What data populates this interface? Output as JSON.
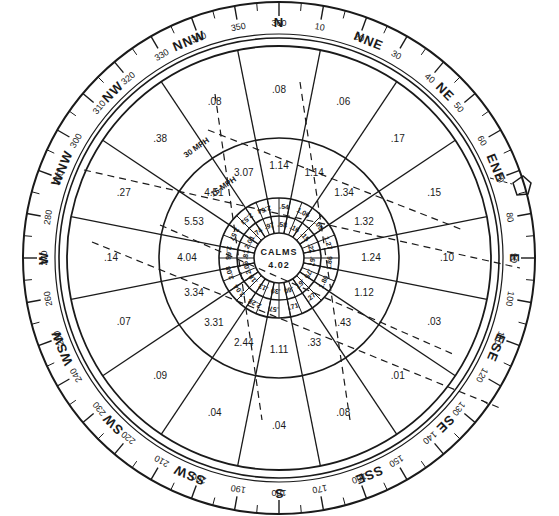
{
  "diagram": {
    "type": "wind-rose",
    "center": {
      "x": 279,
      "y": 258
    },
    "colors": {
      "ink": "#1a1a1a",
      "paper": "#ffffff"
    },
    "directions": [
      "N",
      "NNE",
      "NE",
      "ENE",
      "E",
      "ESE",
      "SE",
      "SSE",
      "S",
      "SSW",
      "SW",
      "WSW",
      "W",
      "WNW",
      "NW",
      "NNW"
    ],
    "degree_labels": [
      "360",
      "10",
      "20",
      "30",
      "40",
      "50",
      "60",
      "70",
      "80",
      "90",
      "100",
      "110",
      "120",
      "130",
      "140",
      "150",
      "160",
      "170",
      "180",
      "190",
      "200",
      "210",
      "220",
      "230",
      "240",
      "250",
      "260",
      "270",
      "280",
      "290",
      "300",
      "310",
      "320",
      "330",
      "340",
      "350"
    ],
    "calms": {
      "label": "CALMS",
      "value": "4.02"
    },
    "speed_labels": {
      "ring_outer": "30 MPH",
      "ring_middle": "15 MPH"
    },
    "sectors": {
      "N": {
        "outer": ".08",
        "middle": "1.14"
      },
      "NNE": {
        "outer": ".06",
        "middle": "1.14"
      },
      "NE": {
        "outer": ".17",
        "middle": "1.34"
      },
      "ENE": {
        "outer": ".15",
        "middle": "1.32"
      },
      "E": {
        "outer": ".10",
        "middle": "1.24"
      },
      "ESE": {
        "outer": ".03",
        "middle": "1.12"
      },
      "SE": {
        "outer": ".01",
        "middle": ".43"
      },
      "SSE": {
        "outer": ".08",
        "middle": ".33"
      },
      "S": {
        "outer": ".04",
        "middle": "1.11"
      },
      "SSW": {
        "outer": ".04",
        "middle": "2.44"
      },
      "SW": {
        "outer": ".09",
        "middle": "3.31"
      },
      "WSW": {
        "outer": ".07",
        "middle": "3.34"
      },
      "W": {
        "outer": ".14",
        "middle": "4.04"
      },
      "WNW": {
        "outer": ".27",
        "middle": "5.53"
      },
      "NW": {
        "outer": ".38",
        "middle": "4.51"
      },
      "NNW": {
        "outer": ".08",
        "middle": "3.07"
      }
    },
    "inner_ring": [
      ".54",
      "1.06",
      ".09",
      "1.27",
      "1.86",
      "1.80",
      ".27",
      ".71",
      ".57",
      "2.28",
      "3.04",
      "3.08",
      "2.66",
      "2.57",
      "2.53",
      "2.64"
    ],
    "innermost_ring": [
      ".58",
      ".16",
      ".15",
      ".22",
      ".67",
      ".75",
      ".67",
      ".60",
      ".39",
      ".13",
      ".18",
      "2.06",
      ".81",
      "2.01",
      ".74",
      ".97"
    ],
    "extra_label": "1.5"
  }
}
